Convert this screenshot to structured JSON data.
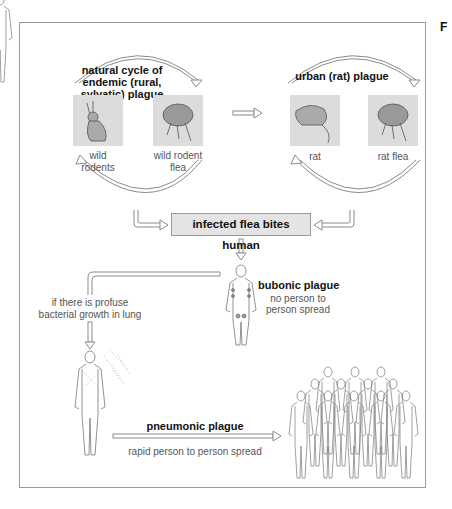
{
  "figure": {
    "letter": "F",
    "left_cycle": {
      "title_lines": [
        "natural cycle of",
        "endemic (rural,",
        "sylvatic) plague"
      ],
      "items": [
        {
          "icon": "rabbit-icon",
          "label_lines": [
            "wild",
            "rodents"
          ]
        },
        {
          "icon": "flea-icon",
          "label_lines": [
            "wild rodent",
            "flea"
          ]
        }
      ]
    },
    "right_cycle": {
      "title": "urban (rat) plague",
      "items": [
        {
          "icon": "rat-icon",
          "label": "rat"
        },
        {
          "icon": "flea-icon",
          "label": "rat flea"
        }
      ]
    },
    "central_event": "infected flea bites human",
    "bubonic": {
      "title": "bubonic plague",
      "desc_lines": [
        "no person to",
        "person spread"
      ]
    },
    "condition_lines": [
      "if there is profuse",
      "bacterial growth in lung"
    ],
    "pneumonic": {
      "title": "pneumonic plague",
      "desc": "rapid person to person spread"
    },
    "colors": {
      "frame": "#9a9a9a",
      "image_bg": "#dcdcdc",
      "box_bg": "#e4e4e4",
      "arrow_stroke": "#8a8a8a"
    }
  }
}
